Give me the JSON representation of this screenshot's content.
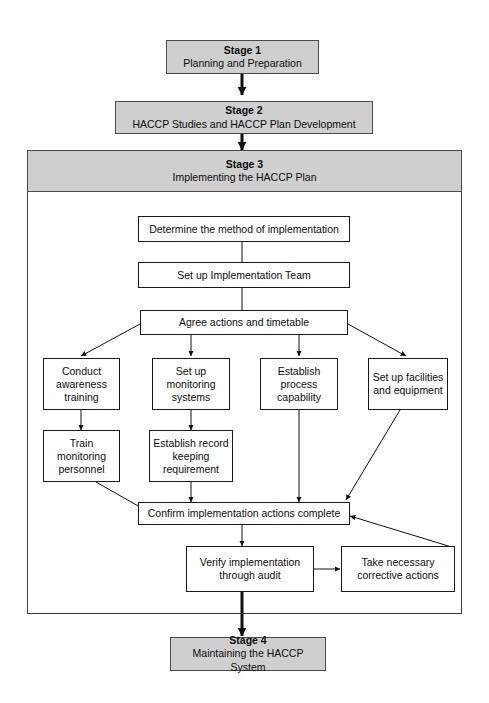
{
  "diagram": {
    "colors": {
      "stage_fill": "#cfcfcf",
      "node_fill": "#ffffff",
      "stroke": "#1a1a1a",
      "background": "#ffffff"
    }
  },
  "stages": {
    "stage1": {
      "title": "Stage 1",
      "subtitle": "Planning and Preparation"
    },
    "stage2": {
      "title": "Stage 2",
      "subtitle": "HACCP Studies and HACCP Plan Development"
    },
    "stage3": {
      "title": "Stage 3",
      "subtitle": "Implementing the HACCP Plan"
    },
    "stage4": {
      "title": "Stage 4",
      "subtitle": "Maintaining the HACCP System"
    }
  },
  "nodes": {
    "determine_method": "Determine the method of implementation",
    "implementation_team": "Set up Implementation Team",
    "agree_actions": "Agree actions and timetable",
    "conduct_awareness": "Conduct awareness training",
    "setup_monitoring": "Set up monitoring systems",
    "establish_process": "Establish process capability",
    "setup_facilities": "Set up facilities and equipment",
    "train_monitoring": "Train monitoring personnel",
    "establish_record": "Establish record keeping requirement",
    "confirm_actions": "Confirm implementation actions complete",
    "verify_audit": "Verify implementation through audit",
    "corrective_actions": "Take necessary corrective actions"
  },
  "flow": {
    "edges": [
      {
        "from": "stage1",
        "to": "stage2",
        "type": "thick-arrow"
      },
      {
        "from": "stage2",
        "to": "stage3",
        "type": "thick-arrow"
      },
      {
        "from": "determine_method",
        "to": "implementation_team",
        "type": "line"
      },
      {
        "from": "implementation_team",
        "to": "agree_actions",
        "type": "line"
      },
      {
        "from": "agree_actions",
        "to": "conduct_awareness",
        "type": "arrow"
      },
      {
        "from": "agree_actions",
        "to": "setup_monitoring",
        "type": "arrow"
      },
      {
        "from": "agree_actions",
        "to": "establish_process",
        "type": "arrow"
      },
      {
        "from": "agree_actions",
        "to": "setup_facilities",
        "type": "arrow"
      },
      {
        "from": "conduct_awareness",
        "to": "train_monitoring",
        "type": "arrow"
      },
      {
        "from": "setup_monitoring",
        "to": "establish_record",
        "type": "arrow"
      },
      {
        "from": "train_monitoring",
        "to": "confirm_actions",
        "type": "arrow"
      },
      {
        "from": "establish_record",
        "to": "confirm_actions",
        "type": "arrow"
      },
      {
        "from": "establish_process",
        "to": "confirm_actions",
        "type": "arrow"
      },
      {
        "from": "setup_facilities",
        "to": "confirm_actions",
        "type": "arrow"
      },
      {
        "from": "confirm_actions",
        "to": "verify_audit",
        "type": "arrow"
      },
      {
        "from": "verify_audit",
        "to": "corrective_actions",
        "type": "arrow"
      },
      {
        "from": "corrective_actions",
        "to": "confirm_actions",
        "type": "arrow"
      },
      {
        "from": "verify_audit",
        "to": "stage4",
        "type": "thick-arrow"
      }
    ]
  }
}
